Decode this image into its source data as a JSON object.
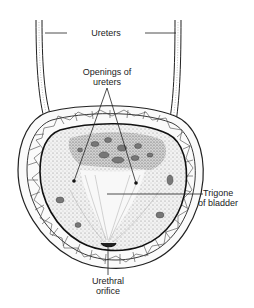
{
  "diagram": {
    "labels": {
      "ureters": "Ureters",
      "openings_line1": "Openings of",
      "openings_line2": "ureters",
      "trigone_line1": "Trigone",
      "trigone_line2": "of bladder",
      "urethral_line1": "Urethral",
      "urethral_line2": "orifice"
    },
    "colors": {
      "background": "#ffffff",
      "ink": "#222222",
      "mucosa_fill": "#e6e6e6",
      "mucosa_dark": "#9a9a9a",
      "wall_fill": "#fafafa"
    }
  }
}
